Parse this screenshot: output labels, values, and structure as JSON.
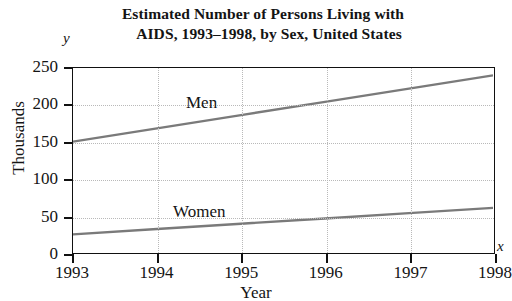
{
  "title": {
    "line1": "Estimated Number of Persons Living with",
    "line2": "AIDS, 1993–1998, by Sex, United States"
  },
  "axis_letters": {
    "y": "y",
    "x": "x"
  },
  "labels": {
    "ylabel": "Thousands",
    "xlabel": "Year"
  },
  "chart_data": {
    "type": "line",
    "title": "Estimated Number of Persons Living with AIDS, 1993–1998, by Sex, United States",
    "xlabel": "Year",
    "ylabel": "Thousands",
    "x": [
      1993,
      1994,
      1995,
      1996,
      1997,
      1998
    ],
    "xtick_labels": [
      "1993",
      "1994",
      "1995",
      "1996",
      "1997",
      "1998"
    ],
    "ytick_labels": [
      "0",
      "50",
      "100",
      "150",
      "200",
      "250"
    ],
    "yticks": [
      0,
      50,
      100,
      150,
      200,
      250
    ],
    "xlim": [
      1993,
      1998
    ],
    "ylim": [
      0,
      250
    ],
    "grid": true,
    "legend": "inline-labels",
    "series": [
      {
        "name": "Men",
        "color": "#7a7a7a",
        "values": [
          150,
          168,
          186,
          204,
          222,
          240
        ],
        "label_x": 1994.6,
        "label_y": 215
      },
      {
        "name": "Women",
        "color": "#7a7a7a",
        "values": [
          24,
          31.2,
          38.4,
          45.6,
          52.8,
          60
        ],
        "label_x": 1994.4,
        "label_y": 72
      }
    ]
  }
}
